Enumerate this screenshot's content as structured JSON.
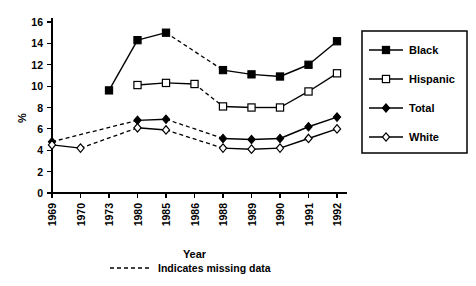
{
  "chart_data": {
    "type": "line",
    "title": "",
    "xlabel": "Year",
    "ylabel": "%",
    "categories": [
      "1969",
      "1970",
      "1973",
      "1980",
      "1985",
      "1986",
      "1988",
      "1989",
      "1990",
      "1991",
      "1992"
    ],
    "ylim": [
      0,
      16
    ],
    "yticks": [
      0,
      2,
      4,
      6,
      8,
      10,
      12,
      14,
      16
    ],
    "grid": false,
    "legend_position": "right",
    "annotations": [
      "Indicates missing data"
    ],
    "series": [
      {
        "name": "Black",
        "marker": "filled-square",
        "values": [
          null,
          null,
          9.6,
          14.3,
          15.0,
          null,
          11.5,
          11.1,
          10.9,
          12.0,
          14.2
        ],
        "dashed_segments": [
          [
            4,
            6
          ]
        ]
      },
      {
        "name": "Hispanic",
        "marker": "open-square",
        "values": [
          null,
          null,
          null,
          10.1,
          10.3,
          10.2,
          8.1,
          8.0,
          8.0,
          9.5,
          11.2
        ],
        "dashed_segments": [
          [
            5,
            6
          ]
        ]
      },
      {
        "name": "Total",
        "marker": "filled-diamond",
        "values": [
          4.8,
          null,
          null,
          6.8,
          6.9,
          null,
          5.1,
          5.0,
          5.1,
          6.2,
          7.1
        ],
        "dashed_segments": [
          [
            0,
            3
          ],
          [
            4,
            6
          ]
        ]
      },
      {
        "name": "White",
        "marker": "open-diamond",
        "values": [
          4.5,
          4.2,
          null,
          6.1,
          5.9,
          null,
          4.2,
          4.1,
          4.2,
          5.1,
          6.0
        ],
        "dashed_segments": [
          [
            1,
            3
          ],
          [
            4,
            6
          ]
        ]
      }
    ]
  },
  "legend": {
    "items": [
      {
        "label": "Black"
      },
      {
        "label": "Hispanic"
      },
      {
        "label": "Total"
      },
      {
        "label": "White"
      }
    ]
  },
  "footnote": {
    "text": "Indicates missing data"
  },
  "axes": {
    "y_title": "%",
    "x_title": "Year"
  },
  "colors": {
    "ink": "#000000",
    "background": "#ffffff"
  }
}
